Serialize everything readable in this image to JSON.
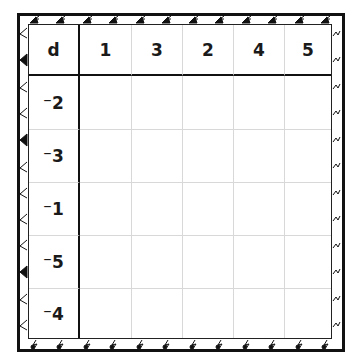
{
  "puzzle": {
    "corner_label": "d",
    "column_headers": [
      "1",
      "3",
      "2",
      "4",
      "5"
    ],
    "row_headers": [
      "⁻2",
      "⁻3",
      "⁻1",
      "⁻5",
      "⁻4"
    ],
    "cells": [
      [
        "",
        "",
        "",
        "",
        ""
      ],
      [
        "",
        "",
        "",
        "",
        ""
      ],
      [
        "",
        "",
        "",
        "",
        ""
      ],
      [
        "",
        "",
        "",
        "",
        ""
      ],
      [
        "",
        "",
        "",
        "",
        ""
      ]
    ]
  },
  "colors": {
    "border": "#111111",
    "gridline": "#d8d8d8",
    "text": "#1a1a1a",
    "background": "#ffffff"
  }
}
